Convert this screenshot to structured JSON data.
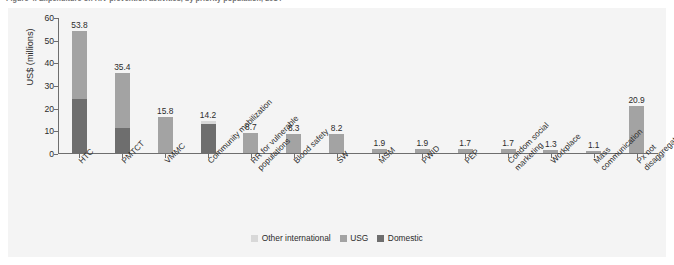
{
  "figure": {
    "title": "Figure 4. Expenditure on HIV prevention activities, by priority population, 2014",
    "ylabel": "US$ (millions)"
  },
  "legend": {
    "position": "bottom-center",
    "items": [
      {
        "label": "Other international",
        "color": "#d8d8d8",
        "key": "other"
      },
      {
        "label": "USG",
        "color": "#a3a3a3",
        "key": "usg"
      },
      {
        "label": "Domestic",
        "color": "#6e6e6e",
        "key": "domestic"
      }
    ]
  },
  "yaxis": {
    "ticks": [
      "0",
      "10",
      "20",
      "30",
      "40",
      "50",
      "60"
    ],
    "min": 0,
    "max": 60,
    "step": 10
  },
  "chart_data": {
    "type": "bar",
    "subtype": "stacked-vertical",
    "title": "Figure 4. Expenditure on HIV prevention activities, by priority population, 2014",
    "xlabel": "",
    "ylabel": "US$ (millions)",
    "ylim": [
      0,
      60
    ],
    "ytick_step": 10,
    "grid": false,
    "legend_position": "bottom-center",
    "categories": [
      "HTC",
      "PMTCT",
      "VMMC",
      "Community mobilization",
      "RR for vulnerable\npopulations",
      "Blood safety",
      "SW",
      "MSM",
      "PWID",
      "PEP",
      "Condom social\nmarketing",
      "Workplace",
      "Mass communication",
      "Px not disaggregated"
    ],
    "series": [
      {
        "name": "Domestic",
        "color": "#6e6e6e",
        "values": [
          23.8,
          10.9,
          0.0,
          12.7,
          0.0,
          0.0,
          0.0,
          0.0,
          0.0,
          0.0,
          0.0,
          0.0,
          0.0,
          0.0
        ]
      },
      {
        "name": "USG",
        "color": "#a3a3a3",
        "values": [
          30.0,
          24.5,
          15.8,
          0.0,
          8.7,
          8.3,
          8.2,
          1.9,
          1.9,
          1.7,
          1.7,
          1.3,
          1.1,
          20.9
        ]
      },
      {
        "name": "Other international",
        "color": "#d8d8d8",
        "values": [
          0.0,
          0.0,
          0.0,
          1.5,
          0.0,
          0.0,
          0.0,
          0.0,
          0.0,
          0.0,
          0.0,
          0.0,
          0.0,
          0.0
        ]
      }
    ],
    "totals": [
      53.8,
      35.4,
      15.8,
      14.2,
      8.7,
      8.3,
      8.2,
      1.9,
      1.9,
      1.7,
      1.7,
      1.3,
      1.1,
      20.9
    ],
    "data_labels": [
      "53.8",
      "35.4",
      "15.8",
      "14.2",
      "8.7",
      "8.3",
      "8.2",
      "1.9",
      "1.9",
      "1.7",
      "1.7",
      "1.3",
      "1.1",
      "20.9"
    ]
  }
}
